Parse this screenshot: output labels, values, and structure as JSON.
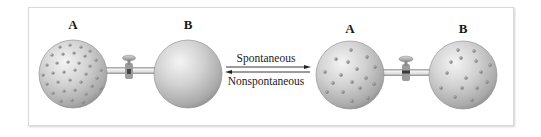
{
  "figure": {
    "colors": {
      "bulb_light": "#e8e8e8",
      "bulb_mid": "#bdbdbd",
      "bulb_dark": "#8a8a8a",
      "molecule": "#7d7d7d",
      "arrow": "#222222",
      "frame_border": "#d9d9d9"
    },
    "initial_state": {
      "bulb_a_label": "A",
      "bulb_b_label": "B",
      "bulb_a_contents": "gas molecules",
      "bulb_b_contents": "empty (evacuated)",
      "stopcock": "closed"
    },
    "process": {
      "forward_label": "Spontaneous",
      "reverse_label": "Nonspontaneous",
      "forward_direction": "right",
      "reverse_direction": "left"
    },
    "final_state": {
      "bulb_a_label": "A",
      "bulb_b_label": "B",
      "bulb_a_contents": "gas molecules (half)",
      "bulb_b_contents": "gas molecules (half)",
      "stopcock": "open"
    }
  }
}
